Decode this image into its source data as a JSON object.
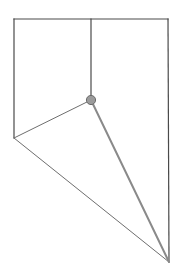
{
  "canvas": {
    "width": 179,
    "height": 272,
    "background_color": "#ffffff"
  },
  "figure": {
    "title": ""
  },
  "colors": {
    "outline_stroke": "#4a4a4a",
    "thin_stroke": "#6e6e6e",
    "thick_stroke": "#8a8a8a",
    "node_fill": "#9b9b9b",
    "node_stroke": "#6a6a6a"
  },
  "points": {
    "top_left": {
      "x": 14,
      "y": 19
    },
    "top_right": {
      "x": 168,
      "y": 19
    },
    "top_mid": {
      "x": 91,
      "y": 19
    },
    "left_vertex": {
      "x": 14,
      "y": 138
    },
    "node": {
      "x": 91,
      "y": 100
    },
    "apex": {
      "x": 169,
      "y": 262
    }
  },
  "node": {
    "label": "pivot-node",
    "radius": 4.6,
    "center_x": 91,
    "center_y": 100
  },
  "segments": [
    {
      "name": "top-edge",
      "from": "top_left",
      "to": "top_right",
      "width": 1.2,
      "color": "#4a4a4a"
    },
    {
      "name": "left-edge",
      "from": "top_left",
      "to": "left_vertex",
      "width": 1.2,
      "color": "#4a4a4a"
    },
    {
      "name": "right-edge",
      "from": "top_right",
      "to": "apex",
      "width": 1.2,
      "color": "#4a4a4a"
    },
    {
      "name": "vertical-stem",
      "from": "top_mid",
      "to": "node",
      "width": 1.2,
      "color": "#4a4a4a"
    },
    {
      "name": "node-to-left-vertex",
      "from": "node",
      "to": "left_vertex",
      "width": 1.0,
      "color": "#6e6e6e"
    },
    {
      "name": "left-vertex-to-apex",
      "from": "left_vertex",
      "to": "apex",
      "width": 1.0,
      "color": "#6e6e6e"
    },
    {
      "name": "node-to-apex",
      "from": "node",
      "to": "apex",
      "width": 2.0,
      "color": "#8a8a8a"
    }
  ]
}
